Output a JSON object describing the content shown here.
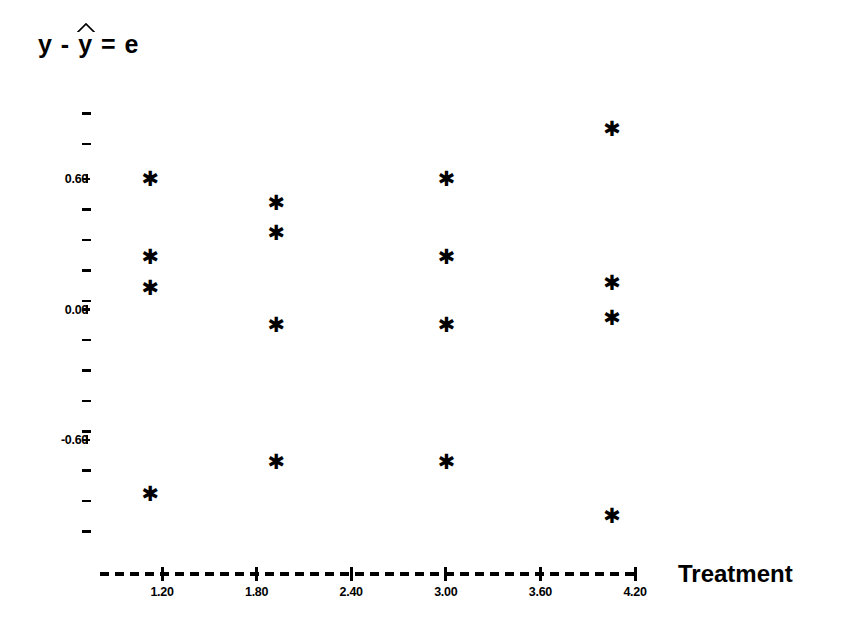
{
  "chart_data": {
    "type": "scatter",
    "title_parts": {
      "lead": "y - ",
      "hatted_symbol": "y",
      "tail": "= e"
    },
    "xlabel": "Treatment",
    "ylabel": "",
    "xlim": [
      0.96,
      4.44
    ],
    "ylim": [
      -1.08,
      1.02
    ],
    "grid": false,
    "legend": false,
    "marker": "asterisk",
    "marker_color": "#000000",
    "xticks": [
      1.2,
      1.8,
      2.4,
      3.0,
      3.6,
      4.2
    ],
    "xtick_labels": [
      "1.20",
      "1.80",
      "2.40",
      "3.00",
      "3.60",
      "4.20"
    ],
    "yticks": [
      0.6,
      0.0,
      -0.6
    ],
    "ytick_labels": [
      "0.60",
      "0.00",
      "-0.60"
    ],
    "y_minor_ticks": [
      0.9,
      0.76,
      0.46,
      0.32,
      0.18,
      0.04,
      -0.14,
      -0.28,
      -0.42,
      -0.56,
      -0.74,
      -0.88,
      -1.02
    ],
    "x_axis_style": "dashed",
    "points": [
      {
        "x": 1.12,
        "y": 0.6
      },
      {
        "x": 1.12,
        "y": 0.24
      },
      {
        "x": 1.12,
        "y": 0.1
      },
      {
        "x": 1.12,
        "y": -0.85
      },
      {
        "x": 1.92,
        "y": 0.49
      },
      {
        "x": 1.92,
        "y": 0.35
      },
      {
        "x": 1.92,
        "y": -0.07
      },
      {
        "x": 1.92,
        "y": -0.7
      },
      {
        "x": 3.0,
        "y": 0.6
      },
      {
        "x": 3.0,
        "y": 0.24
      },
      {
        "x": 3.0,
        "y": -0.07
      },
      {
        "x": 3.0,
        "y": -0.7
      },
      {
        "x": 4.05,
        "y": 0.83
      },
      {
        "x": 4.05,
        "y": 0.12
      },
      {
        "x": 4.05,
        "y": -0.04
      },
      {
        "x": 4.05,
        "y": -0.95
      }
    ],
    "groups": [
      {
        "treatment": 1,
        "x": 1.12,
        "residuals": [
          0.6,
          0.24,
          0.1,
          -0.85
        ]
      },
      {
        "treatment": 2,
        "x": 1.92,
        "residuals": [
          0.49,
          0.35,
          -0.07,
          -0.7
        ]
      },
      {
        "treatment": 3,
        "x": 3.0,
        "residuals": [
          0.6,
          0.24,
          -0.07,
          -0.7
        ]
      },
      {
        "treatment": 4,
        "x": 4.05,
        "residuals": [
          0.83,
          0.12,
          -0.04,
          -0.95
        ]
      }
    ],
    "marker_glyph": "✱"
  }
}
